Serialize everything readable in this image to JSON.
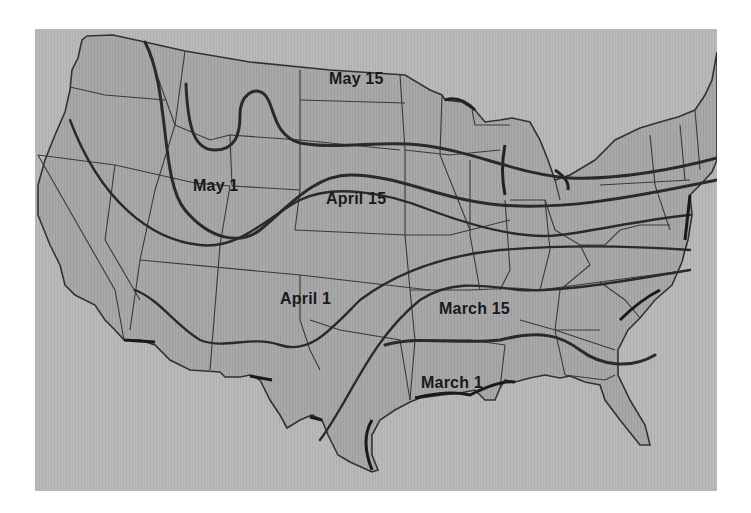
{
  "map": {
    "title": "Average last spring frost dates",
    "colors": {
      "ocean": "#b9b9b9",
      "land": "#a9a9a9",
      "border": "#333333",
      "frost_line": "#2a2a2a",
      "label": "#1a1a1a"
    },
    "frost_lines": [
      {
        "label": "May 15",
        "x": 329,
        "y": 68
      },
      {
        "label": "May 1",
        "x": 193,
        "y": 178
      },
      {
        "label": "April 15",
        "x": 326,
        "y": 190
      },
      {
        "label": "April 1",
        "x": 280,
        "y": 290
      },
      {
        "label": "March 15",
        "x": 439,
        "y": 300
      },
      {
        "label": "March 1",
        "x": 421,
        "y": 374
      }
    ]
  }
}
